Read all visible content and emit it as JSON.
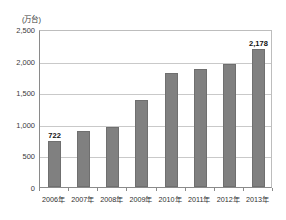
{
  "top_strip": {
    "ghost_text": " "
  },
  "chart_data": {
    "type": "bar",
    "title": "",
    "subtitle": "",
    "unit_label": "(万台)",
    "xlabel": "",
    "ylabel": "",
    "categories": [
      "2006年",
      "2007年",
      "2008年",
      "2009年",
      "2010年",
      "2011年",
      "2012年",
      "2013年"
    ],
    "values": [
      722,
      890,
      950,
      1370,
      1810,
      1860,
      1940,
      2178
    ],
    "point_labels": [
      "722",
      "",
      "",
      "",
      "",
      "",
      "",
      "2,178"
    ],
    "ylim": [
      0,
      2500
    ],
    "ytick_values": [
      0,
      500,
      1000,
      1500,
      2000,
      2500
    ],
    "ytick_labels": [
      "0",
      "500",
      "1,000",
      "1,500",
      "2,000",
      "2,500"
    ],
    "grid": true,
    "grid_axis": "y",
    "legend": false,
    "legend_position": "none",
    "bar_color": "#808080",
    "bar_border_color": "#6f6f6f",
    "grid_color": "#c9c9c9",
    "axis_color": "#8a8a8a",
    "text_color": "#2f2f2f"
  }
}
